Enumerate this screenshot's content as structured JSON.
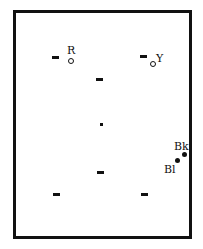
{
  "diagram": {
    "frame_color": "#111111",
    "background": "#ffffff",
    "markers": [
      {
        "id": "R",
        "label": "R",
        "shape": "open-circle"
      },
      {
        "id": "Y",
        "label": "Y",
        "shape": "open-circle"
      },
      {
        "id": "Bk",
        "label": "Bk",
        "shape": "filled-circle"
      },
      {
        "id": "Bl",
        "label": "Bl",
        "shape": "filled-circle"
      }
    ],
    "dashes": 6,
    "center_dot": true
  }
}
